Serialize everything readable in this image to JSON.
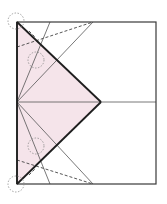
{
  "diagram": {
    "type": "origami-crease-pattern",
    "width": 167,
    "height": 204,
    "colors": {
      "background": "#ffffff",
      "frame": "#3a3a3a",
      "fold_edge": "#1e1e1e",
      "crease": "#555555",
      "valley": "#444444",
      "circle": "#8a8a8a",
      "fill": "#f5e4ea"
    },
    "frame": {
      "x1": 17,
      "y1": 22,
      "x2": 156,
      "y2": 184
    },
    "shaded_polygon": "17,22 101,102 17,184",
    "fold_edges": [
      {
        "x1": 17,
        "y1": 22,
        "x2": 101,
        "y2": 102
      },
      {
        "x1": 101,
        "y1": 102,
        "x2": 17,
        "y2": 184
      },
      {
        "x1": 17,
        "y1": 22,
        "x2": 17,
        "y2": 184
      }
    ],
    "crease_lines": [
      {
        "x1": 17,
        "y1": 102,
        "x2": 156,
        "y2": 102
      },
      {
        "x1": 17,
        "y1": 102,
        "x2": 50,
        "y2": 22
      },
      {
        "x1": 17,
        "y1": 102,
        "x2": 93,
        "y2": 22
      },
      {
        "x1": 17,
        "y1": 102,
        "x2": 50,
        "y2": 184
      },
      {
        "x1": 17,
        "y1": 102,
        "x2": 93,
        "y2": 184
      }
    ],
    "valley_lines": [
      {
        "x1": 17,
        "y1": 47,
        "x2": 93,
        "y2": 22
      },
      {
        "x1": 17,
        "y1": 160,
        "x2": 93,
        "y2": 184
      },
      {
        "x1": 29,
        "y1": 31,
        "x2": 36,
        "y2": 38
      },
      {
        "x1": 29,
        "y1": 175,
        "x2": 36,
        "y2": 168
      }
    ],
    "circles": [
      {
        "cx": 16,
        "cy": 21,
        "r": 8
      },
      {
        "cx": 36,
        "cy": 60,
        "r": 8
      },
      {
        "cx": 36,
        "cy": 146,
        "r": 8
      },
      {
        "cx": 16,
        "cy": 184,
        "r": 8
      }
    ]
  }
}
